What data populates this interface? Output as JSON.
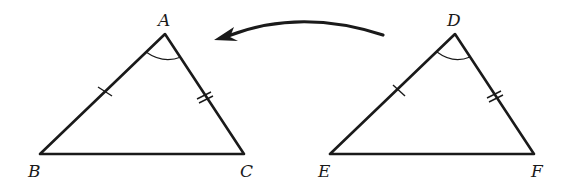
{
  "diagram": {
    "type": "congruent-triangles-SAS",
    "colors": {
      "stroke": "#1a1a1a",
      "background": "#ffffff"
    },
    "triangles": [
      {
        "name": "ABC",
        "vertices": {
          "A": {
            "label": "A",
            "x": 165,
            "y": 34
          },
          "B": {
            "label": "B",
            "x": 40,
            "y": 154
          },
          "C": {
            "label": "C",
            "x": 244,
            "y": 154
          }
        },
        "marks": {
          "AB": "single-tick",
          "AC": "double-tick",
          "angle_A": "arc"
        }
      },
      {
        "name": "DEF",
        "vertices": {
          "D": {
            "label": "D",
            "x": 455,
            "y": 34
          },
          "E": {
            "label": "E",
            "x": 330,
            "y": 154
          },
          "F": {
            "label": "F",
            "x": 534,
            "y": 154
          }
        },
        "marks": {
          "DE": "single-tick",
          "DF": "double-tick",
          "angle_D": "arc"
        }
      }
    ],
    "arrow": {
      "from": "DEF",
      "to": "ABC",
      "direction": "right-to-left",
      "shape": "curved"
    }
  },
  "labels": {
    "A": "A",
    "B": "B",
    "C": "C",
    "D": "D",
    "E": "E",
    "F": "F"
  }
}
